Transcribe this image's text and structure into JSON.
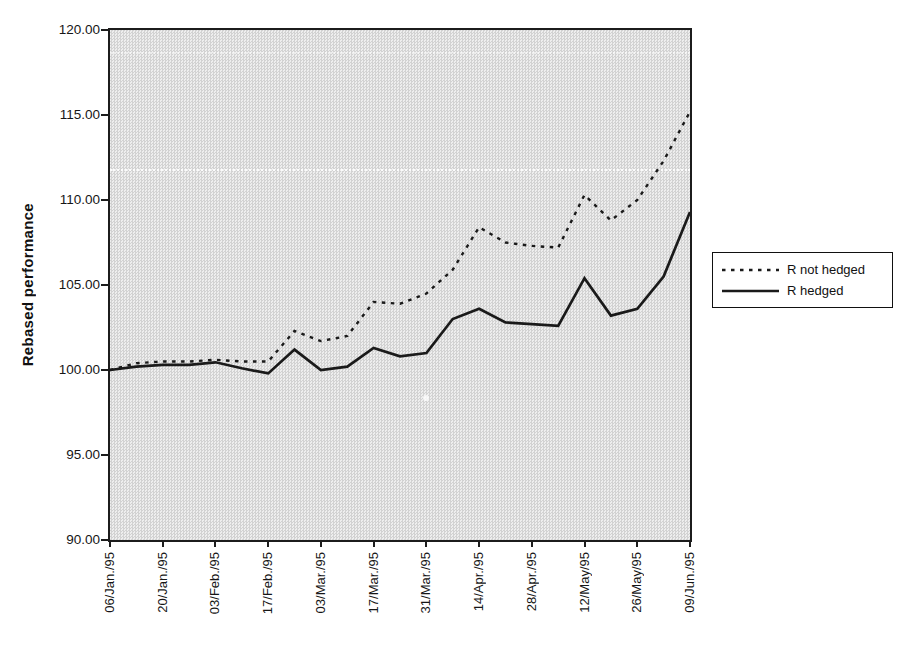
{
  "colors": {
    "line": "#1a1a1a",
    "stipple_dark": "#d2d2d2",
    "stipple_light": "#eeeeee",
    "page_bg": "#ffffff"
  },
  "chart_data": {
    "type": "line",
    "title": "",
    "xlabel": "",
    "ylabel": "Rebased performance",
    "ylim": [
      90,
      120
    ],
    "ytick_interval": 5,
    "ytick_labels": [
      "120.00",
      "115.00",
      "110.00",
      "105.00",
      "100.00",
      "95.00",
      "90.00"
    ],
    "categories": [
      "06/Jan./95",
      "13/Jan./95",
      "20/Jan./95",
      "27/Jan./95",
      "03/Feb./95",
      "10/Feb./95",
      "17/Feb./95",
      "24/Feb./95",
      "03/Mar./95",
      "10/Mar./95",
      "17/Mar./95",
      "24/Mar./95",
      "31/Mar./95",
      "07/Apr./95",
      "14/Apr./95",
      "21/Apr./95",
      "28/Apr./95",
      "05/May/95",
      "12/May/95",
      "19/May/95",
      "26/May/95",
      "02/Jun./95",
      "09/Jun./95"
    ],
    "visible_x_tick_labels": [
      "06/Jan./95",
      "20/Jan./95",
      "03/Feb./95",
      "17/Feb./95",
      "03/Mar./95",
      "17/Mar./95",
      "31/Mar./95",
      "14/Apr./95",
      "28/Apr./95",
      "12/May/95",
      "26/May/95",
      "09/Jun./95"
    ],
    "series": [
      {
        "name": "R not hedged",
        "line_style": "dashed",
        "values": [
          100.0,
          100.4,
          100.5,
          100.5,
          100.6,
          100.5,
          100.5,
          102.3,
          101.7,
          102.0,
          104.0,
          103.9,
          104.5,
          105.9,
          108.4,
          107.5,
          107.3,
          107.2,
          110.3,
          108.8,
          110.0,
          112.3,
          115.2
        ]
      },
      {
        "name": "R hedged",
        "line_style": "solid",
        "values": [
          100.0,
          100.2,
          100.3,
          100.3,
          100.45,
          100.1,
          99.8,
          101.2,
          100.0,
          100.2,
          101.3,
          100.8,
          101.0,
          103.0,
          103.6,
          102.8,
          102.7,
          102.6,
          105.4,
          103.2,
          103.6,
          105.5,
          109.3
        ]
      }
    ],
    "legend_position": "outside-right",
    "grid": false,
    "plot_background": "gray-stipple"
  }
}
